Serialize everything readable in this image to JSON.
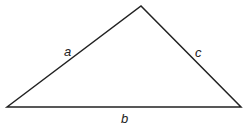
{
  "diagram": {
    "type": "triangle",
    "stroke_color": "#222222",
    "background": "#ffffff",
    "vertices": {
      "left": {
        "x": 7,
        "y": 107
      },
      "top": {
        "x": 141,
        "y": 6
      },
      "right": {
        "x": 241,
        "y": 107
      }
    },
    "sides": [
      {
        "id": "a",
        "label": "a",
        "from": "left",
        "to": "top"
      },
      {
        "id": "c",
        "label": "c",
        "from": "top",
        "to": "right"
      },
      {
        "id": "b",
        "label": "b",
        "from": "left",
        "to": "right"
      }
    ]
  }
}
